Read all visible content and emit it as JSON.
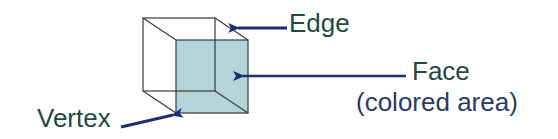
{
  "diagram": {
    "colors": {
      "label_text": "#1e4a40",
      "subtitle_text": "#283a68",
      "arrow": "#1d2f6e",
      "face_fill": "#b3d4d8",
      "edge_stroke": "#3a3a3a"
    },
    "labels": {
      "edge": "Edge",
      "face": "Face",
      "face_note": "(colored area)",
      "vertex": "Vertex"
    },
    "cube": {
      "back_square": {
        "x": 143,
        "y": 18,
        "size": 72
      },
      "front_square": {
        "x": 176,
        "y": 40,
        "size": 72
      }
    },
    "arrows": {
      "edge": {
        "from": [
          287,
          28
        ],
        "to": [
          236,
          28
        ]
      },
      "face": {
        "from": [
          406,
          76
        ],
        "to": [
          241,
          76
        ]
      },
      "vertex": {
        "from": [
          121,
          126
        ],
        "to": [
          175,
          114
        ]
      }
    }
  }
}
